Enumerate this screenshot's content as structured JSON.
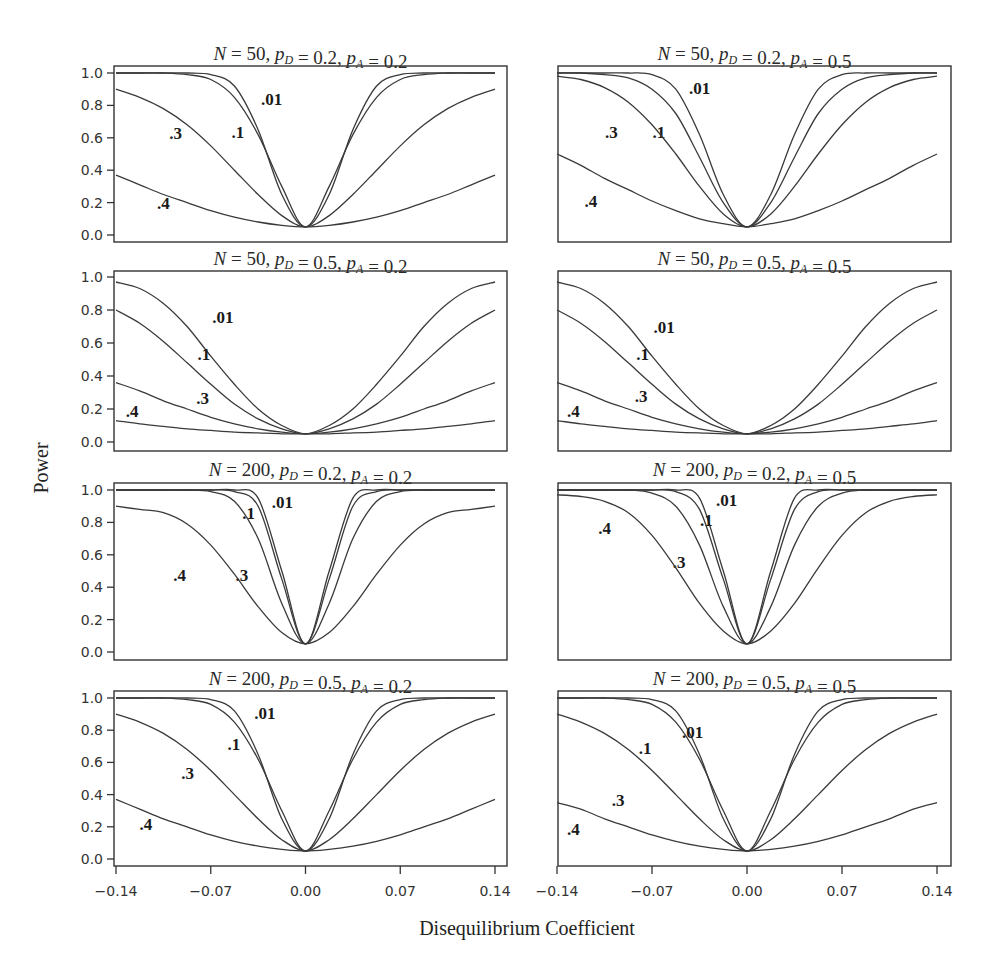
{
  "chart_data": {
    "type": "line",
    "ylabel": "Power",
    "xlabel": "Disequilibrium Coefficient",
    "x_ticks": [
      "-0.14",
      "-0.07",
      "0.00",
      "0.07",
      "0.14"
    ],
    "y_ticks": [
      "0.0",
      "0.2",
      "0.4",
      "0.6",
      "0.8",
      "1.0"
    ],
    "xlim": [
      -0.14,
      0.14
    ],
    "ylim": [
      0,
      1
    ],
    "grid": false,
    "legend": "inline curve labels (.01, .1, .3, .4)",
    "half_x": [
      0,
      0.0175,
      0.035,
      0.0525,
      0.07,
      0.0875,
      0.105,
      0.1225,
      0.14
    ],
    "symmetric": true,
    "panels": [
      {
        "title": {
          "N": "50",
          "pD": "0.2",
          "pA": "0.2"
        },
        "series": [
          {
            "name": ".01",
            "values": [
              0.05,
              0.25,
              0.65,
              0.92,
              0.99,
              1.0,
              1.0,
              1.0,
              1.0
            ],
            "label_pos": [
              -0.025,
              0.8
            ]
          },
          {
            "name": ".1",
            "values": [
              0.05,
              0.3,
              0.62,
              0.85,
              0.96,
              0.99,
              1.0,
              1.0,
              1.0
            ],
            "label_pos": [
              -0.05,
              0.6
            ]
          },
          {
            "name": ".3",
            "values": [
              0.05,
              0.12,
              0.25,
              0.4,
              0.55,
              0.68,
              0.78,
              0.85,
              0.9
            ],
            "label_pos": [
              -0.096,
              0.59
            ]
          },
          {
            "name": ".4",
            "values": [
              0.05,
              0.06,
              0.08,
              0.11,
              0.15,
              0.2,
              0.25,
              0.31,
              0.37
            ],
            "label_pos": [
              -0.105,
              0.16
            ]
          }
        ]
      },
      {
        "title": {
          "N": "50",
          "pD": "0.2",
          "pA": "0.5"
        },
        "series": [
          {
            "name": ".01",
            "values": [
              0.05,
              0.25,
              0.62,
              0.9,
              0.99,
              1.0,
              1.0,
              1.0,
              1.0
            ],
            "label_pos": [
              -0.035,
              0.87
            ]
          },
          {
            "name": ".1",
            "values": [
              0.05,
              0.2,
              0.48,
              0.75,
              0.9,
              0.97,
              0.99,
              1.0,
              1.0
            ],
            "label_pos": [
              -0.065,
              0.6
            ]
          },
          {
            "name": ".3",
            "values": [
              0.05,
              0.13,
              0.3,
              0.5,
              0.68,
              0.82,
              0.91,
              0.96,
              0.98
            ],
            "label_pos": [
              -0.1,
              0.6
            ]
          },
          {
            "name": ".4",
            "values": [
              0.05,
              0.07,
              0.1,
              0.15,
              0.21,
              0.28,
              0.35,
              0.43,
              0.5
            ],
            "label_pos": [
              -0.115,
              0.17
            ]
          }
        ]
      },
      {
        "title": {
          "N": "50",
          "pD": "0.5",
          "pA": "0.2"
        },
        "series": [
          {
            "name": ".01",
            "values": [
              0.05,
              0.1,
              0.2,
              0.35,
              0.52,
              0.7,
              0.84,
              0.93,
              0.97
            ],
            "label_pos": [
              -0.061,
              0.72
            ]
          },
          {
            "name": ".1",
            "values": [
              0.05,
              0.08,
              0.14,
              0.23,
              0.35,
              0.48,
              0.61,
              0.72,
              0.8
            ],
            "label_pos": [
              -0.075,
              0.5
            ]
          },
          {
            "name": ".3",
            "values": [
              0.05,
              0.06,
              0.08,
              0.11,
              0.15,
              0.2,
              0.25,
              0.31,
              0.36
            ],
            "label_pos": [
              -0.076,
              0.23
            ]
          },
          {
            "name": ".4",
            "values": [
              0.05,
              0.05,
              0.055,
              0.06,
              0.07,
              0.08,
              0.095,
              0.11,
              0.13
            ],
            "label_pos": [
              -0.128,
              0.15
            ]
          }
        ]
      },
      {
        "title": {
          "N": "50",
          "pD": "0.5",
          "pA": "0.5"
        },
        "series": [
          {
            "name": ".01",
            "values": [
              0.05,
              0.1,
              0.2,
              0.35,
              0.52,
              0.7,
              0.84,
              0.93,
              0.97
            ],
            "label_pos": [
              -0.061,
              0.66
            ]
          },
          {
            "name": ".1",
            "values": [
              0.05,
              0.08,
              0.14,
              0.23,
              0.35,
              0.48,
              0.61,
              0.72,
              0.8
            ],
            "label_pos": [
              -0.077,
              0.5
            ]
          },
          {
            "name": ".3",
            "values": [
              0.05,
              0.06,
              0.08,
              0.11,
              0.15,
              0.2,
              0.25,
              0.31,
              0.36
            ],
            "label_pos": [
              -0.078,
              0.24
            ]
          },
          {
            "name": ".4",
            "values": [
              0.05,
              0.05,
              0.055,
              0.06,
              0.07,
              0.08,
              0.095,
              0.11,
              0.13
            ],
            "label_pos": [
              -0.128,
              0.15
            ]
          }
        ]
      },
      {
        "title": {
          "N": "200",
          "pD": "0.2",
          "pA": "0.2"
        },
        "series": [
          {
            "name": ".01",
            "values": [
              0.05,
              0.5,
              0.95,
              1.0,
              1.0,
              1.0,
              1.0,
              1.0,
              1.0
            ],
            "label_pos": [
              -0.017,
              0.89
            ]
          },
          {
            "name": ".1",
            "values": [
              0.05,
              0.45,
              0.9,
              0.99,
              1.0,
              1.0,
              1.0,
              1.0,
              1.0
            ],
            "label_pos": [
              -0.042,
              0.82
            ]
          },
          {
            "name": ".3",
            "values": [
              0.05,
              0.3,
              0.7,
              0.93,
              0.99,
              1.0,
              1.0,
              1.0,
              1.0
            ],
            "label_pos": [
              -0.047,
              0.44
            ]
          },
          {
            "name": ".4",
            "values": [
              0.05,
              0.12,
              0.28,
              0.48,
              0.66,
              0.79,
              0.86,
              0.88,
              0.9
            ],
            "label_pos": [
              -0.093,
              0.44
            ]
          }
        ]
      },
      {
        "title": {
          "N": "200",
          "pD": "0.2",
          "pA": "0.5"
        },
        "series": [
          {
            "name": ".01",
            "values": [
              0.05,
              0.5,
              0.95,
              1.0,
              1.0,
              1.0,
              1.0,
              1.0,
              1.0
            ],
            "label_pos": [
              -0.015,
              0.9
            ]
          },
          {
            "name": ".1",
            "values": [
              0.05,
              0.45,
              0.88,
              0.99,
              1.0,
              1.0,
              1.0,
              1.0,
              1.0
            ],
            "label_pos": [
              -0.03,
              0.78
            ]
          },
          {
            "name": ".3",
            "values": [
              0.05,
              0.28,
              0.66,
              0.9,
              0.98,
              1.0,
              1.0,
              1.0,
              1.0
            ],
            "label_pos": [
              -0.05,
              0.52
            ]
          },
          {
            "name": ".4",
            "values": [
              0.05,
              0.13,
              0.3,
              0.52,
              0.72,
              0.86,
              0.93,
              0.96,
              0.97
            ],
            "label_pos": [
              -0.105,
              0.73
            ]
          }
        ]
      },
      {
        "title": {
          "N": "200",
          "pD": "0.5",
          "pA": "0.2"
        },
        "series": [
          {
            "name": ".01",
            "values": [
              0.05,
              0.25,
              0.65,
              0.92,
              0.99,
              1.0,
              1.0,
              1.0,
              1.0
            ],
            "label_pos": [
              -0.03,
              0.87
            ]
          },
          {
            "name": ".1",
            "values": [
              0.05,
              0.3,
              0.62,
              0.85,
              0.96,
              0.99,
              1.0,
              1.0,
              1.0
            ],
            "label_pos": [
              -0.053,
              0.68
            ]
          },
          {
            "name": ".3",
            "values": [
              0.05,
              0.12,
              0.25,
              0.4,
              0.55,
              0.68,
              0.78,
              0.85,
              0.9
            ],
            "label_pos": [
              -0.087,
              0.5
            ]
          },
          {
            "name": ".4",
            "values": [
              0.05,
              0.06,
              0.08,
              0.11,
              0.15,
              0.2,
              0.25,
              0.31,
              0.37
            ],
            "label_pos": [
              -0.118,
              0.18
            ]
          }
        ]
      },
      {
        "title": {
          "N": "200",
          "pD": "0.5",
          "pA": "0.5"
        },
        "series": [
          {
            "name": ".01",
            "values": [
              0.05,
              0.25,
              0.65,
              0.92,
              0.99,
              1.0,
              1.0,
              1.0,
              1.0
            ],
            "label_pos": [
              -0.04,
              0.75
            ]
          },
          {
            "name": ".1",
            "values": [
              0.05,
              0.3,
              0.62,
              0.85,
              0.96,
              0.99,
              1.0,
              1.0,
              1.0
            ],
            "label_pos": [
              -0.075,
              0.65
            ]
          },
          {
            "name": ".3",
            "values": [
              0.05,
              0.12,
              0.25,
              0.4,
              0.55,
              0.68,
              0.78,
              0.85,
              0.9
            ],
            "label_pos": [
              -0.095,
              0.33
            ]
          },
          {
            "name": ".4",
            "values": [
              0.05,
              0.06,
              0.08,
              0.11,
              0.15,
              0.2,
              0.25,
              0.31,
              0.35
            ],
            "label_pos": [
              -0.128,
              0.15
            ]
          }
        ]
      }
    ]
  },
  "labels": {
    "ylabel": "Power",
    "xlabel": "Disequilibrium Coefficient"
  }
}
